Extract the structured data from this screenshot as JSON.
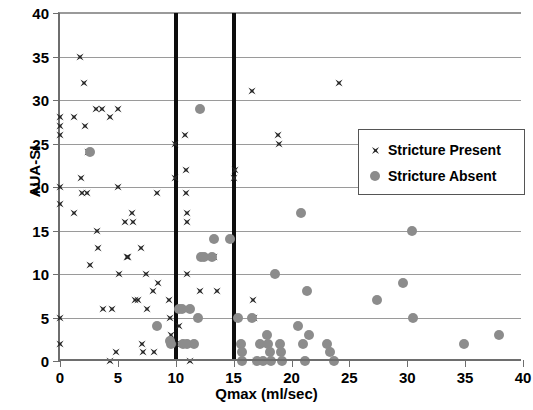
{
  "chart_data": {
    "type": "scatter",
    "title": "",
    "xlabel": "Qmax (ml/sec)",
    "ylabel": "AUA-SI",
    "xlim": [
      0,
      40
    ],
    "ylim": [
      0,
      40
    ],
    "xticks": [
      0,
      5,
      10,
      15,
      20,
      25,
      30,
      35,
      40
    ],
    "yticks": [
      0,
      5,
      10,
      15,
      20,
      25,
      30,
      35,
      40
    ],
    "grid": "horizontal",
    "legend_position": "upper-right-inside",
    "reference_lines": [
      {
        "name": "qmax-10-line",
        "axis": "x",
        "value": 10
      },
      {
        "name": "qmax-15-line",
        "axis": "x",
        "value": 15
      }
    ],
    "series": [
      {
        "name": "Stricture Present",
        "marker": "star",
        "color": "#262626",
        "points": [
          [
            0,
            28
          ],
          [
            0,
            27
          ],
          [
            0,
            26
          ],
          [
            0,
            20
          ],
          [
            0,
            18
          ],
          [
            0,
            5
          ],
          [
            0,
            2
          ],
          [
            1.2,
            28
          ],
          [
            1.2,
            17
          ],
          [
            1.7,
            35
          ],
          [
            1.8,
            21
          ],
          [
            1.9,
            19.3
          ],
          [
            2.1,
            32
          ],
          [
            2.2,
            27
          ],
          [
            2.3,
            19.3
          ],
          [
            2.4,
            24
          ],
          [
            2.6,
            11
          ],
          [
            3.1,
            29
          ],
          [
            3.2,
            15
          ],
          [
            3.3,
            13
          ],
          [
            3.6,
            29
          ],
          [
            3.7,
            6
          ],
          [
            4.3,
            28
          ],
          [
            4.3,
            0
          ],
          [
            4.5,
            6
          ],
          [
            4.8,
            1
          ],
          [
            5.0,
            20
          ],
          [
            5.0,
            29
          ],
          [
            5.1,
            10
          ],
          [
            5.6,
            16
          ],
          [
            5.8,
            12
          ],
          [
            5.9,
            12
          ],
          [
            6.2,
            17
          ],
          [
            6.3,
            16
          ],
          [
            6.5,
            7
          ],
          [
            6.7,
            7
          ],
          [
            7.0,
            13
          ],
          [
            7.1,
            2
          ],
          [
            7.2,
            1
          ],
          [
            7.4,
            10
          ],
          [
            7.5,
            6
          ],
          [
            8.0,
            8
          ],
          [
            8.1,
            1
          ],
          [
            8.4,
            19.3
          ],
          [
            8.5,
            9
          ],
          [
            9.4,
            7
          ],
          [
            9.5,
            5
          ],
          [
            9.6,
            3
          ],
          [
            9.6,
            2.3
          ],
          [
            9.9,
            21
          ],
          [
            9.9,
            25
          ],
          [
            10.0,
            2
          ],
          [
            10.3,
            4
          ],
          [
            10.8,
            26
          ],
          [
            10.9,
            22
          ],
          [
            10.9,
            19.3
          ],
          [
            11.0,
            17
          ],
          [
            11.0,
            16
          ],
          [
            11.0,
            10
          ],
          [
            11.1,
            2
          ],
          [
            11.2,
            0
          ],
          [
            12.1,
            8
          ],
          [
            13.3,
            12
          ],
          [
            13.6,
            8
          ],
          [
            15.0,
            21
          ],
          [
            15.1,
            22
          ],
          [
            16.6,
            31
          ],
          [
            16.7,
            7
          ],
          [
            16.8,
            5
          ],
          [
            16.9,
            0
          ],
          [
            18.8,
            26
          ],
          [
            18.9,
            25
          ],
          [
            24.1,
            32
          ]
        ]
      },
      {
        "name": "Stricture Absent",
        "marker": "circle",
        "color": "#8c8c8c",
        "points": [
          [
            2.6,
            24
          ],
          [
            8.4,
            4
          ],
          [
            9.5,
            2.3
          ],
          [
            9.6,
            2
          ],
          [
            10.3,
            6
          ],
          [
            10.5,
            6
          ],
          [
            10.6,
            2
          ],
          [
            11.0,
            2
          ],
          [
            11.2,
            6
          ],
          [
            11.6,
            2
          ],
          [
            11.9,
            5
          ],
          [
            12.1,
            29
          ],
          [
            12.2,
            12
          ],
          [
            12.4,
            12
          ],
          [
            13.1,
            12
          ],
          [
            13.3,
            14
          ],
          [
            14.7,
            14
          ],
          [
            15.4,
            5
          ],
          [
            15.6,
            2
          ],
          [
            15.7,
            1
          ],
          [
            15.7,
            0
          ],
          [
            16.6,
            5
          ],
          [
            17.0,
            0
          ],
          [
            17.3,
            2
          ],
          [
            17.5,
            0
          ],
          [
            17.9,
            3
          ],
          [
            18.0,
            2
          ],
          [
            18.1,
            1
          ],
          [
            18.2,
            0
          ],
          [
            18.6,
            10
          ],
          [
            19.0,
            2
          ],
          [
            19.1,
            1
          ],
          [
            19.2,
            0
          ],
          [
            20.6,
            4
          ],
          [
            20.8,
            17
          ],
          [
            21.0,
            2
          ],
          [
            21.2,
            0
          ],
          [
            21.5,
            3
          ],
          [
            21.3,
            8
          ],
          [
            23.1,
            2
          ],
          [
            23.3,
            1
          ],
          [
            23.7,
            0
          ],
          [
            27.4,
            7
          ],
          [
            29.6,
            9
          ],
          [
            30.4,
            15
          ],
          [
            30.5,
            5
          ],
          [
            34.9,
            2
          ],
          [
            37.9,
            3
          ]
        ]
      }
    ]
  },
  "legend": {
    "entries": [
      {
        "label": "Stricture Present",
        "marker": "star",
        "color": "#262626"
      },
      {
        "label": "Stricture Absent",
        "marker": "circle",
        "color": "#8c8c8c"
      }
    ]
  },
  "axes": {
    "x": {
      "title": "Qmax (ml/sec)",
      "tick_labels": [
        "0",
        "5",
        "10",
        "15",
        "20",
        "25",
        "30",
        "35",
        "40"
      ]
    },
    "y": {
      "title": "AUA-SI",
      "tick_labels": [
        "0",
        "5",
        "10",
        "15",
        "20",
        "25",
        "30",
        "35",
        "40"
      ]
    }
  }
}
